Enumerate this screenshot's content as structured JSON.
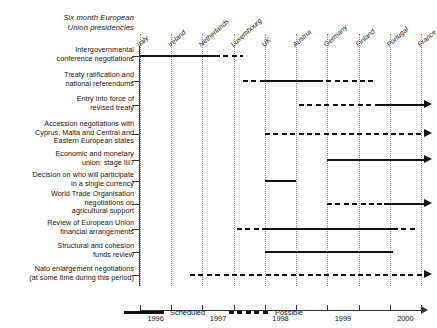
{
  "chart_data": {
    "type": "bar",
    "chart_kind": "gantt-timeline",
    "xlabel": "",
    "ylabel": "",
    "xlim": [
      1996.0,
      2000.5
    ],
    "grid": true,
    "legend_position": "bottom-center",
    "tick_labels": [
      "1996",
      "1997",
      "1998",
      "1999",
      "2000"
    ],
    "tick_values": [
      1996,
      1997,
      1998,
      1999,
      2000
    ],
    "presidencies": [
      {
        "country": "Italy",
        "start": 1996.0
      },
      {
        "country": "Ireland",
        "start": 1996.5
      },
      {
        "country": "Netherlands",
        "start": 1997.0
      },
      {
        "country": "Luxembourg",
        "start": 1997.5
      },
      {
        "country": "UK",
        "start": 1998.0
      },
      {
        "country": "Austria",
        "start": 1998.5
      },
      {
        "country": "Germany",
        "start": 1999.0
      },
      {
        "country": "Finland",
        "start": 1999.5
      },
      {
        "country": "Portugal",
        "start": 2000.0
      },
      {
        "country": "France",
        "start": 2000.5
      }
    ],
    "categories": [
      "Intergovernmental conference negotiations",
      "Treaty ratification and national referendums",
      "Entry into force of revised treaty",
      "Accession negotiations with Cyprus, Malta and Central and Eastern European states",
      "Economic and monetary union: stage III?",
      "Decision on who will participate in a single currency",
      "World Trade Organisation negotiations on agricultural support",
      "Review of European Union financial arrangements",
      "Structural and cohesion funds review",
      "Nato enlargement negotiations (at some time during this period)"
    ],
    "series": [
      {
        "name": "Scheduled",
        "style": "solid",
        "color": "#111111"
      },
      {
        "name": "Possible",
        "style": "dashed",
        "color": "#111111"
      }
    ],
    "rows": [
      {
        "label_lines": [
          "Intergovernmental",
          "conference negotiations"
        ],
        "segments": [
          {
            "series": "Scheduled",
            "start": 1996.0,
            "end": 1997.2,
            "arrow": false
          },
          {
            "series": "Possible",
            "start": 1997.2,
            "end": 1997.65,
            "arrow": false
          }
        ]
      },
      {
        "label_lines": [
          "Treaty ratification and",
          "national referendums"
        ],
        "segments": [
          {
            "series": "Possible",
            "start": 1997.65,
            "end": 1998.0,
            "arrow": false
          },
          {
            "series": "Scheduled",
            "start": 1998.0,
            "end": 1998.85,
            "arrow": false
          },
          {
            "series": "Possible",
            "start": 1998.85,
            "end": 1999.8,
            "arrow": false
          }
        ]
      },
      {
        "label_lines": [
          "Entry into force of",
          "revised treaty"
        ],
        "segments": [
          {
            "series": "Possible",
            "start": 1998.55,
            "end": 1999.8,
            "arrow": false
          },
          {
            "series": "Scheduled",
            "start": 1999.8,
            "end": 2000.55,
            "arrow": true
          }
        ]
      },
      {
        "label_lines": [
          "Accession negotiations with",
          "Cyprus, Malta and Central and",
          "Eastern European states"
        ],
        "segments": [
          {
            "series": "Possible",
            "start": 1998.0,
            "end": 2000.55,
            "arrow": true
          }
        ]
      },
      {
        "label_lines": [
          "Economic and monetary",
          "union: stage III?"
        ],
        "segments": [
          {
            "series": "Scheduled",
            "start": 1999.0,
            "end": 2000.55,
            "arrow": true
          }
        ]
      },
      {
        "label_lines": [
          "Decision on who will participate",
          "in a single currency"
        ],
        "segments": [
          {
            "series": "Scheduled",
            "start": 1998.0,
            "end": 1998.5,
            "arrow": false
          }
        ]
      },
      {
        "label_lines": [
          "World Trade Organisation",
          "negotiations on",
          "agricultural support"
        ],
        "segments": [
          {
            "series": "Possible",
            "start": 1999.0,
            "end": 1999.9,
            "arrow": false
          },
          {
            "series": "Scheduled",
            "start": 1999.9,
            "end": 2000.55,
            "arrow": true
          }
        ]
      },
      {
        "label_lines": [
          "Review of European Union",
          "financial arrangements"
        ],
        "segments": [
          {
            "series": "Possible",
            "start": 1997.55,
            "end": 1998.0,
            "arrow": false
          },
          {
            "series": "Scheduled",
            "start": 1998.0,
            "end": 2000.05,
            "arrow": false
          },
          {
            "series": "Possible",
            "start": 2000.05,
            "end": 2000.42,
            "arrow": false
          }
        ]
      },
      {
        "label_lines": [
          "Structural and cohesion",
          "funds review"
        ],
        "segments": [
          {
            "series": "Scheduled",
            "start": 1998.0,
            "end": 2000.05,
            "arrow": false
          }
        ]
      },
      {
        "label_lines": [
          "Nato enlargement negotiations",
          "(at some time during this period)"
        ],
        "segments": [
          {
            "series": "Possible",
            "start": 1996.8,
            "end": 2000.55,
            "arrow": true
          }
        ]
      }
    ]
  }
}
